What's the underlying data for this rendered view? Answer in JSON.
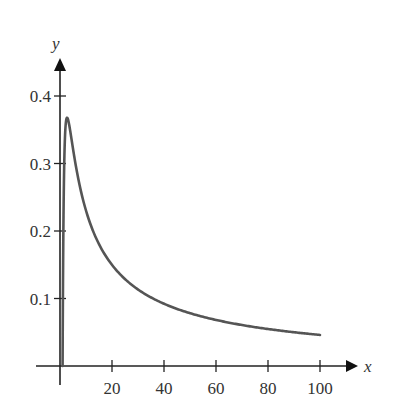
{
  "chart_data": {
    "type": "line",
    "title": "",
    "xlabel": "x",
    "ylabel": "y",
    "function": "y = ln(x) / x",
    "xlim": [
      0,
      110
    ],
    "ylim": [
      0,
      0.42
    ],
    "grid": false,
    "legend": null,
    "x_ticks": [
      20,
      40,
      60,
      80,
      100
    ],
    "x_tick_labels": [
      "20",
      "40",
      "60",
      "80",
      "100"
    ],
    "y_ticks": [
      0.1,
      0.2,
      0.3,
      0.4
    ],
    "y_tick_labels": [
      "0.1",
      "0.2",
      "0.3",
      "0.4"
    ],
    "series": [
      {
        "name": "ln(x)/x",
        "color": "#555555",
        "x": [
          1,
          1.5,
          2,
          2.718,
          3,
          4,
          5,
          7,
          10,
          15,
          20,
          30,
          40,
          50,
          60,
          70,
          80,
          90,
          100
        ],
        "y": [
          0,
          0.27,
          0.347,
          0.368,
          0.366,
          0.347,
          0.322,
          0.278,
          0.23,
          0.181,
          0.15,
          0.113,
          0.092,
          0.078,
          0.068,
          0.061,
          0.055,
          0.05,
          0.046
        ]
      }
    ],
    "annotations": []
  },
  "colors": {
    "axis": "#222222",
    "curve": "#555555",
    "text": "#333333"
  }
}
